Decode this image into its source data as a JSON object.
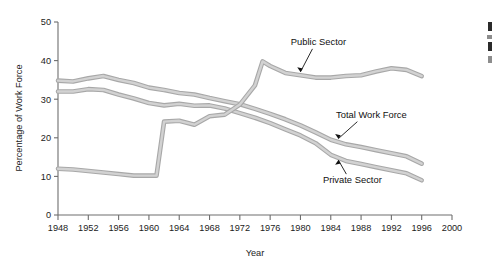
{
  "chart_data": {
    "type": "line",
    "title": "",
    "xlabel": "Year",
    "ylabel": "Percentage of Work Force",
    "xlim": [
      1948,
      2000
    ],
    "ylim": [
      0,
      50
    ],
    "grid": false,
    "legend_position": "inline-annotations",
    "x_ticks": [
      1948,
      1952,
      1956,
      1960,
      1964,
      1968,
      1972,
      1976,
      1980,
      1984,
      1988,
      1992,
      1996,
      2000
    ],
    "x_tick_labels": [
      "1948",
      "1952",
      "1956",
      "1960",
      "1964",
      "1968",
      "1972",
      "1976",
      "1980",
      "1984",
      "1988",
      "1992",
      "1996",
      "2000"
    ],
    "y_ticks": [
      0,
      10,
      20,
      30,
      40,
      50
    ],
    "y_tick_labels": [
      "0",
      "10",
      "20",
      "30",
      "40",
      "50"
    ],
    "series": [
      {
        "name": "Total Work Force",
        "label": "Total Work Force",
        "color": "#a8a8a8",
        "x": [
          1948,
          1950,
          1952,
          1954,
          1956,
          1958,
          1960,
          1962,
          1964,
          1966,
          1968,
          1970,
          1972,
          1974,
          1976,
          1978,
          1980,
          1982,
          1984,
          1986,
          1988,
          1990,
          1992,
          1994,
          1996
        ],
        "values": [
          34.8,
          34.6,
          35.4,
          36.0,
          35.0,
          34.2,
          33.0,
          32.4,
          31.6,
          31.2,
          30.3,
          29.5,
          28.7,
          27.5,
          26.2,
          24.8,
          23.2,
          21.4,
          19.5,
          18.3,
          17.6,
          16.8,
          16.0,
          15.2,
          13.3
        ]
      },
      {
        "name": "Private Sector",
        "label": "Private Sector",
        "color": "#a8a8a8",
        "x": [
          1948,
          1950,
          1952,
          1954,
          1956,
          1958,
          1960,
          1962,
          1964,
          1966,
          1968,
          1970,
          1972,
          1974,
          1976,
          1978,
          1980,
          1982,
          1984,
          1986,
          1988,
          1990,
          1992,
          1994,
          1996
        ],
        "values": [
          32.0,
          32.0,
          32.6,
          32.4,
          31.2,
          30.2,
          29.0,
          28.4,
          28.8,
          28.3,
          28.4,
          27.6,
          26.4,
          25.2,
          23.8,
          22.2,
          20.6,
          18.6,
          15.6,
          14.0,
          13.2,
          12.4,
          11.6,
          10.8,
          9.0
        ]
      },
      {
        "name": "Public Sector",
        "label": "Public Sector",
        "color": "#a8a8a8",
        "x": [
          1948,
          1950,
          1952,
          1954,
          1956,
          1958,
          1960,
          1961,
          1962,
          1964,
          1966,
          1968,
          1970,
          1972,
          1974,
          1975,
          1976,
          1978,
          1980,
          1982,
          1984,
          1986,
          1988,
          1990,
          1992,
          1994,
          1996
        ],
        "values": [
          12.0,
          11.8,
          11.4,
          11.0,
          10.6,
          10.2,
          10.2,
          10.2,
          24.2,
          24.4,
          23.4,
          25.6,
          26.0,
          28.6,
          33.6,
          39.8,
          38.6,
          36.8,
          36.2,
          35.6,
          35.6,
          36.0,
          36.2,
          37.2,
          38.0,
          37.6,
          36.0
        ]
      }
    ],
    "annotations": [
      {
        "text": "Public Sector",
        "target_year": 1980,
        "target_value": 36.3
      },
      {
        "text": "Total Work Force",
        "target_year": 1985,
        "target_value": 19.0
      },
      {
        "text": "Private Sector",
        "target_year": 1985,
        "target_value": 15.0
      }
    ]
  },
  "axes": {
    "y_title": "Percentage of Work Force",
    "x_title": "Year"
  }
}
